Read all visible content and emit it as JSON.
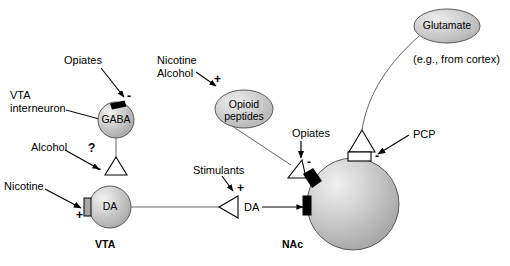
{
  "figure": {
    "background_color": "#ffffff",
    "line_color": "#000000",
    "cell_fill": "#c8c8c8"
  },
  "regions": [
    {
      "id": "vta",
      "label": "VTA",
      "x": 104,
      "y": 243
    },
    {
      "id": "nac",
      "label": "NAc",
      "x": 287,
      "y": 243
    }
  ],
  "cells": [
    {
      "id": "gaba",
      "label": "GABA",
      "shape": "circle",
      "cx": 116,
      "cy": 120,
      "r": 18
    },
    {
      "id": "da",
      "label": "DA",
      "shape": "circle",
      "cx": 110,
      "cy": 207,
      "r": 21
    },
    {
      "id": "opioid_peptides",
      "label_line1": "Opioid",
      "label_line2": "peptides",
      "shape": "ellipse",
      "cx": 244,
      "cy": 109,
      "rx": 29,
      "ry": 19
    },
    {
      "id": "glutamate",
      "label": "Glutamate",
      "shape": "ellipse",
      "cx": 447,
      "cy": 26,
      "rx": 33,
      "ry": 17
    },
    {
      "id": "nac_neuron",
      "label": "",
      "shape": "circle",
      "cx": 353,
      "cy": 204,
      "r": 46
    }
  ],
  "annotations": {
    "opiates_vta": "Opiates",
    "vta_interneuron_line1": "VTA",
    "vta_interneuron_line2": "interneuron",
    "alcohol_vta": "Alcohol",
    "alcohol_question": "?",
    "nicotine_vta": "Nicotine",
    "nicotine_opioid": "Nicotine",
    "alcohol_opioid": "Alcohol",
    "stimulants": "Stimulants",
    "da_transmitter": "DA",
    "opiates_nac": "Opiates",
    "pcp": "PCP",
    "glutamate_source": "(e.g., from cortex)"
  },
  "signs": [
    {
      "id": "sign-opiates-gaba",
      "text": "-",
      "x": 127,
      "y": 96
    },
    {
      "id": "sign-alcohol-da",
      "text": "-",
      "x": 87,
      "y": 163
    },
    {
      "id": "sign-nicotine-da",
      "text": "+",
      "x": 74,
      "y": 211
    },
    {
      "id": "sign-nicotine-alcohol-opioid",
      "text": "+",
      "x": 213,
      "y": 77
    },
    {
      "id": "sign-stimulants",
      "text": "+",
      "x": 237,
      "y": 187
    },
    {
      "id": "sign-opiates-nac",
      "text": "-",
      "x": 304,
      "y": 160
    },
    {
      "id": "sign-pcp",
      "text": "-",
      "x": 372,
      "y": 151
    }
  ],
  "terminals": [
    {
      "id": "terminal-opiates-gaba",
      "type": "filled-bar",
      "note": "black receptor bar on GABA neuron"
    },
    {
      "id": "terminal-alcohol",
      "type": "open-triangle",
      "note": "hollow axon terminal onto DA neuron"
    },
    {
      "id": "terminal-nicotine",
      "type": "gray-receptor",
      "note": "gray receptor on DA cell body"
    },
    {
      "id": "terminal-stimulants",
      "type": "open-triangle-left",
      "note": "hollow DA axon terminal"
    },
    {
      "id": "terminal-da-nac",
      "type": "filled-receptor",
      "note": "black DA receptor on NAc neuron"
    },
    {
      "id": "terminal-opioid-nac",
      "type": "open-triangle-filled-bar",
      "note": "opioid terminal with black receptor on NAc"
    },
    {
      "id": "terminal-glutamate-nac",
      "type": "open-triangle-open-receptor",
      "note": "glutamate terminal with hollow NMDA receptor on NAc"
    }
  ]
}
